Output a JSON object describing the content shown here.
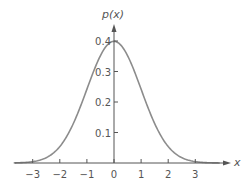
{
  "chart_data": {
    "type": "line",
    "title": "",
    "xlabel": "x",
    "ylabel": "p(x)",
    "xlim": [
      -3.7,
      3.9
    ],
    "ylim": [
      0,
      0.45
    ],
    "grid": false,
    "legend": null,
    "x_ticks": [
      -3,
      -2,
      -1,
      0,
      1,
      2,
      3
    ],
    "x_tick_labels": [
      "−3",
      "−2",
      "−1",
      "0",
      "1",
      "2",
      "3"
    ],
    "y_ticks": [
      0.1,
      0.2,
      0.3,
      0.4
    ],
    "y_tick_labels": [
      "0.1",
      "0.2",
      "0.3",
      "0.4"
    ],
    "series": [
      {
        "name": "standard normal density",
        "description": "p(x) = (1/sqrt(2*pi)) * exp(-x^2/2)",
        "x": [
          -3.7,
          -3.5,
          -3,
          -2.5,
          -2,
          -1.5,
          -1,
          -0.5,
          0,
          0.5,
          1,
          1.5,
          2,
          2.5,
          3,
          3.5,
          3.9
        ],
        "values": [
          0.0004,
          0.0009,
          0.0044,
          0.0175,
          0.054,
          0.1295,
          0.242,
          0.3521,
          0.3989,
          0.3521,
          0.242,
          0.1295,
          0.054,
          0.0175,
          0.0044,
          0.0009,
          0.0002
        ]
      }
    ],
    "colors": {
      "curve": "#8c8c8c",
      "axis": "#555555",
      "text": "#555555"
    }
  },
  "labels": {
    "y_axis": "p(x)",
    "x_axis": "x"
  }
}
